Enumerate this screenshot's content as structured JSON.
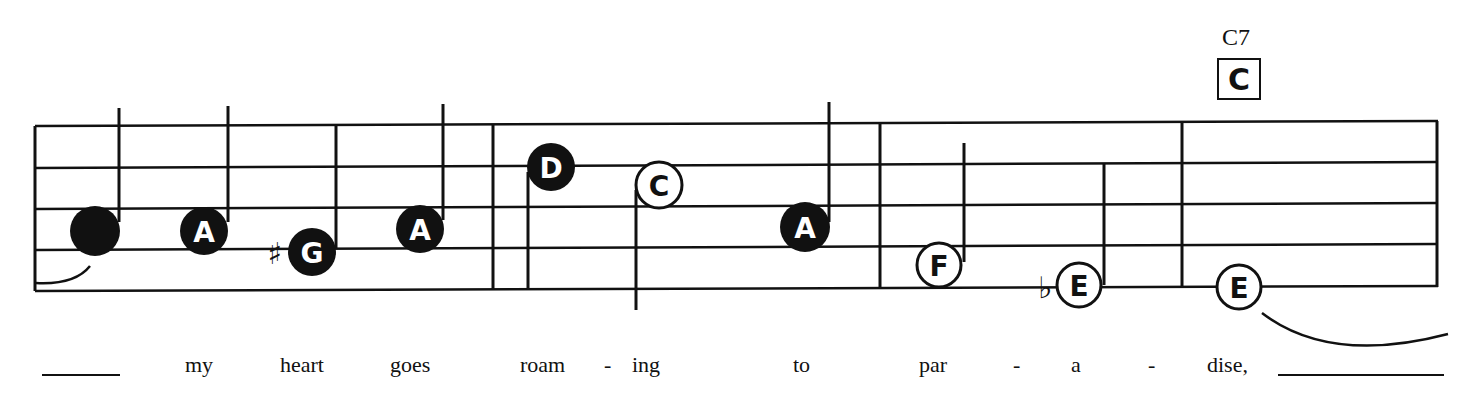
{
  "chord": {
    "name": "C7",
    "diagram_letter": "C"
  },
  "colors": {
    "ink": "#111111",
    "paper": "#ffffff"
  },
  "measures": [
    {
      "notes": [
        {
          "letter": "",
          "filled": true,
          "accidental": ""
        },
        {
          "letter": "A",
          "filled": true,
          "accidental": ""
        },
        {
          "letter": "G",
          "filled": true,
          "accidental": "♯"
        },
        {
          "letter": "A",
          "filled": true,
          "accidental": ""
        }
      ]
    },
    {
      "notes": [
        {
          "letter": "D",
          "filled": true,
          "accidental": ""
        },
        {
          "letter": "C",
          "filled": false,
          "accidental": ""
        },
        {
          "letter": "A",
          "filled": true,
          "accidental": ""
        }
      ]
    },
    {
      "notes": [
        {
          "letter": "F",
          "filled": false,
          "accidental": ""
        },
        {
          "letter": "E",
          "filled": false,
          "accidental": "♭"
        }
      ]
    },
    {
      "notes": [
        {
          "letter": "E",
          "filled": false,
          "accidental": ""
        }
      ]
    }
  ],
  "lyrics": [
    "my",
    "heart",
    "goes",
    "roam",
    "-",
    "ing",
    "to",
    "par",
    "-",
    "a",
    "-",
    "dise,"
  ]
}
